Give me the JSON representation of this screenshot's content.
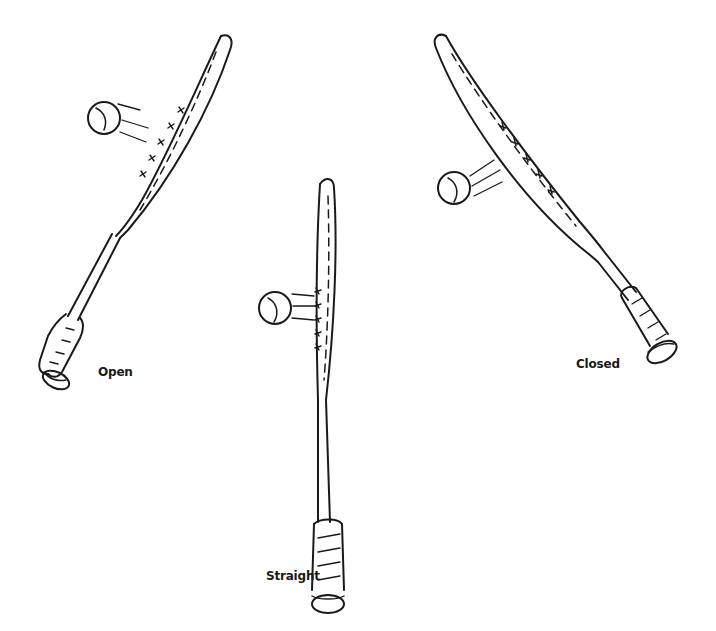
{
  "figure": {
    "rackets": [
      {
        "id": "open",
        "label": "Open"
      },
      {
        "id": "straight",
        "label": "Straight"
      },
      {
        "id": "closed",
        "label": "Closed"
      }
    ]
  },
  "colors": {
    "ink": "#1a1a1a",
    "background": "#ffffff"
  }
}
